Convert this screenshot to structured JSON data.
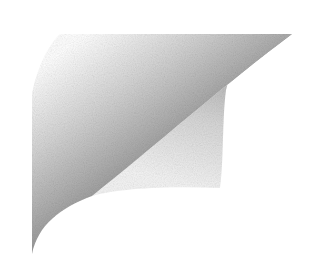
{
  "graphic": {
    "kind": "page-curl",
    "background": "#ffffff",
    "colors": {
      "dark": "#6e6e6e",
      "mid": "#9a9a9a",
      "light": "#e6e6e6",
      "flap_dark": "#a8a8a8",
      "flap_light": "#f2f2f2"
    }
  }
}
